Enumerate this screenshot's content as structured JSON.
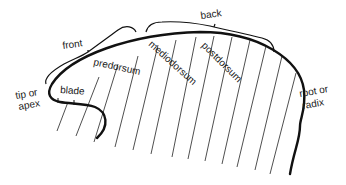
{
  "diagram": {
    "labels": {
      "front": "front",
      "back": "back",
      "tip": "tip or",
      "tip2": "apex",
      "blade": "blade",
      "predorsum": "predorsum",
      "mediodorsum": "mediodorsum",
      "postdorsum": "postdorsum",
      "root": "root or",
      "root2": "radix"
    },
    "colors": {
      "ink": "#111111",
      "background": "#ffffff"
    }
  }
}
